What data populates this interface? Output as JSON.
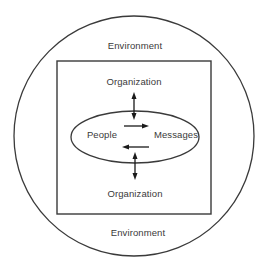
{
  "diagram": {
    "title": "",
    "nodes": {
      "environment_top": {
        "label": "Environment",
        "x": 135,
        "y": 45
      },
      "environment_bottom": {
        "label": "Environment",
        "x": 138,
        "y": 232
      },
      "organization_top": {
        "label": "Organization",
        "x": 134,
        "y": 81
      },
      "organization_bottom": {
        "label": "Organization",
        "x": 135,
        "y": 193
      },
      "people": {
        "label": "People",
        "x": 102,
        "y": 134
      },
      "messages": {
        "label": "Messages",
        "x": 176,
        "y": 134
      }
    },
    "shapes": {
      "environment_circle": {
        "cx": 134,
        "cy": 136,
        "r": 120
      },
      "organization_rect": {
        "x": 57,
        "y": 61,
        "width": 154,
        "height": 153
      },
      "communication_ellipse": {
        "cx": 135,
        "cy": 137,
        "rx": 64,
        "ry": 26
      }
    },
    "edges": [
      {
        "from": "organization_top",
        "to": "communication_ellipse",
        "direction": "bidirectional",
        "orientation": "vertical"
      },
      {
        "from": "people",
        "to": "messages",
        "direction": "forward",
        "orientation": "horizontal"
      },
      {
        "from": "messages",
        "to": "people",
        "direction": "forward",
        "orientation": "horizontal"
      },
      {
        "from": "communication_ellipse",
        "to": "organization_bottom",
        "direction": "bidirectional",
        "orientation": "vertical"
      }
    ],
    "colors": {
      "stroke": "#3a3a3a",
      "text": "#3a3a3a",
      "background": "#ffffff"
    }
  }
}
